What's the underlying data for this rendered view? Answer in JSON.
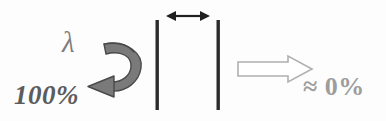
{
  "figure": {
    "background_color": "#fdfdfd"
  },
  "labels": {
    "wavelength_symbol": "λ",
    "reflected_fraction": "100%",
    "transmitted_fraction": "≈ 0%"
  },
  "colors": {
    "reflect_arrow_fill": "#7a7a7a",
    "reflect_arrow_stroke": "#4d4d4d",
    "barrier": "#2b2b2b",
    "gap_arrow": "#1f1f1f",
    "transmit_arrow_stroke": "#b0b0b0",
    "transmit_arrow_fill": "#ffffff",
    "lambda_color": "#7e7e7e",
    "reflect_text_color": "#5c5c5c",
    "transmit_text_color": "#9d9d9d"
  },
  "elements": {
    "reflect_arrow_name": "curved-reflection-arrow",
    "gap_arrow_name": "gap-double-headed-arrow",
    "transmit_arrow_name": "hollow-transmission-arrow",
    "left_barrier_name": "left-barrier",
    "right_barrier_name": "right-barrier"
  },
  "geometry": {
    "left_barrier_x": 157,
    "right_barrier_x": 218,
    "barrier_top": 20,
    "barrier_bottom": 110,
    "gap_arrow_y": 16,
    "gap_arrow_x1": 168,
    "gap_arrow_x2": 208,
    "transmit_arrow_x1": 238,
    "transmit_arrow_x2": 312,
    "transmit_arrow_y": 69
  }
}
